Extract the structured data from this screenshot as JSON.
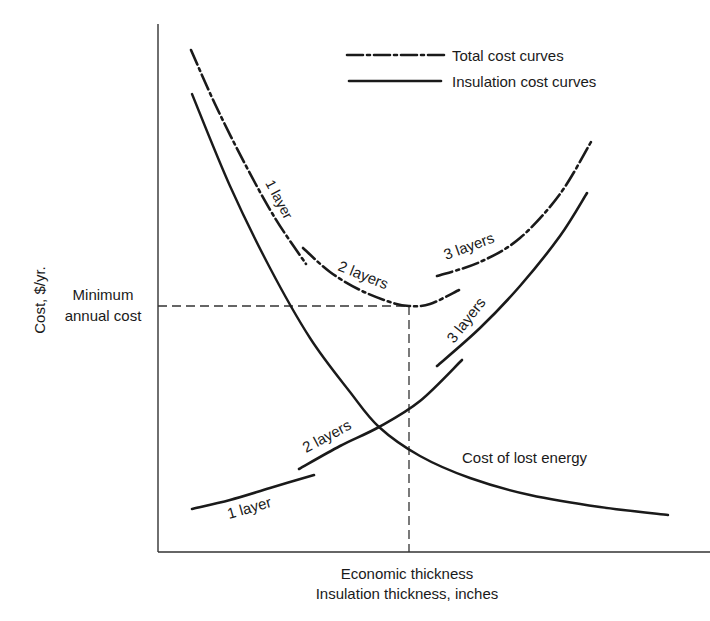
{
  "chart_data": {
    "type": "line",
    "title": "",
    "xlabel": "Insulation thickness, inches",
    "ylabel": "Cost, $/yr.",
    "x_annotation": "Economic thickness",
    "y_annotation": [
      "Minimum",
      "annual cost"
    ],
    "grid": false,
    "ticks": "none (qualitative axes)",
    "legend": {
      "position": "top-right",
      "entries": [
        {
          "label": "Total cost curves",
          "style": "dash-dot"
        },
        {
          "label": "Insulation cost curves",
          "style": "solid"
        }
      ]
    },
    "series": [
      {
        "name": "Total cost - 1 layer",
        "style": "dash-dot",
        "label": "1 layer",
        "points": [
          [
            191,
            50
          ],
          [
            215,
            104
          ],
          [
            245,
            164
          ],
          [
            275,
            218
          ],
          [
            306,
            264
          ]
        ]
      },
      {
        "name": "Total cost - 2 layers",
        "style": "dash-dot",
        "label": "2 layers",
        "points": [
          [
            303,
            248
          ],
          [
            330,
            272
          ],
          [
            360,
            290
          ],
          [
            390,
            302
          ],
          [
            409,
            306
          ],
          [
            430,
            304
          ],
          [
            459,
            290
          ]
        ]
      },
      {
        "name": "Total cost - 3 layers",
        "style": "dash-dot",
        "label": "3 layers",
        "points": [
          [
            437,
            276
          ],
          [
            480,
            262
          ],
          [
            520,
            238
          ],
          [
            560,
            194
          ],
          [
            591,
            142
          ]
        ]
      },
      {
        "name": "Insulation cost - 1 layer",
        "style": "solid",
        "label": "1 layer",
        "points": [
          [
            192,
            509
          ],
          [
            230,
            500
          ],
          [
            270,
            488
          ],
          [
            314,
            475
          ]
        ]
      },
      {
        "name": "Insulation cost - 2 layers",
        "style": "solid",
        "label": "2 layers",
        "points": [
          [
            299,
            469
          ],
          [
            340,
            446
          ],
          [
            379,
            427
          ],
          [
            420,
            401
          ],
          [
            462,
            360
          ]
        ]
      },
      {
        "name": "Insulation cost - 3 layers",
        "style": "solid",
        "label": "3 layers",
        "points": [
          [
            437,
            366
          ],
          [
            480,
            328
          ],
          [
            520,
            286
          ],
          [
            560,
            236
          ],
          [
            587,
            193
          ]
        ]
      },
      {
        "name": "Cost of lost energy",
        "style": "solid",
        "label": "Cost of lost energy",
        "points": [
          [
            192,
            94
          ],
          [
            230,
            186
          ],
          [
            270,
            268
          ],
          [
            310,
            338
          ],
          [
            350,
            392
          ],
          [
            379,
            427
          ],
          [
            420,
            456
          ],
          [
            470,
            478
          ],
          [
            530,
            495
          ],
          [
            600,
            507
          ],
          [
            668,
            515
          ]
        ]
      }
    ],
    "annotations": {
      "minimum_point": [
        409,
        306
      ],
      "economic_thickness_x": 409,
      "minimum_cost_y": 306
    },
    "axes_px": {
      "x0": 158,
      "y0": 552,
      "x1": 710,
      "ytop": 24
    }
  },
  "labels": {
    "legend_total": "Total cost curves",
    "legend_insulation": "Insulation cost curves",
    "ylabel": "Cost, $/yr.",
    "min_cost_line1": "Minimum",
    "min_cost_line2": "annual cost",
    "x_annotation": "Economic thickness",
    "xlabel": "Insulation thickness, inches",
    "total_1": "1 layer",
    "total_2": "2 layers",
    "total_3": "3 layers",
    "ins_1": "1 layer",
    "ins_2": "2 layers",
    "ins_3": "3 layers",
    "lost": "Cost of lost energy"
  }
}
